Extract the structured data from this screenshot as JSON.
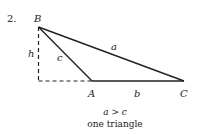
{
  "problem_number": "2.",
  "vertices": {
    "B": "B",
    "A": "A",
    "C": "C"
  },
  "sides": {
    "a": "a",
    "b": "b",
    "c": "c"
  },
  "height_label": "h",
  "condition": "a > c",
  "conclusion": "one triangle",
  "colors": {
    "line": "#222222",
    "background": "#ffffff"
  }
}
